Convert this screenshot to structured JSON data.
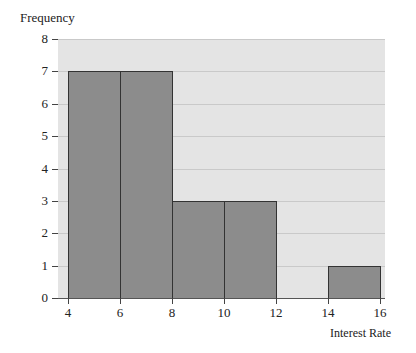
{
  "chart_data": {
    "type": "bar",
    "subtype": "histogram",
    "title": "",
    "xlabel": "Interest Rate",
    "ylabel": "Frequency",
    "bins": [
      [
        4,
        6
      ],
      [
        6,
        8
      ],
      [
        8,
        10
      ],
      [
        10,
        12
      ],
      [
        12,
        14
      ],
      [
        14,
        16
      ]
    ],
    "categories": [
      "4-6",
      "6-8",
      "8-10",
      "10-12",
      "12-14",
      "14-16"
    ],
    "values": [
      7,
      7,
      3,
      3,
      0,
      1
    ],
    "xticks": [
      4,
      6,
      8,
      10,
      12,
      14,
      16
    ],
    "yticks": [
      0,
      1,
      2,
      3,
      4,
      5,
      6,
      7,
      8
    ],
    "xlim": [
      4,
      16
    ],
    "ylim": [
      0,
      8
    ],
    "grid": true,
    "legend": null,
    "colors": {
      "bar": "#8c8c8c",
      "background": "#e4e4e4",
      "gridline": "#c9c9c9"
    }
  }
}
